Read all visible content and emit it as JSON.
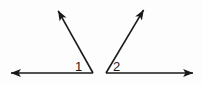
{
  "figure": {
    "type": "geometry-diagram",
    "background_color": "#fdfdfd",
    "stroke_color": "#1a1a1a",
    "stroke_width": 1.6,
    "width": 203,
    "height": 85,
    "labels": [
      {
        "name": "angle-1",
        "text": "1",
        "x": 75,
        "y": 60
      },
      {
        "name": "angle-2",
        "text": "2",
        "x": 113,
        "y": 60
      }
    ],
    "angles": [
      {
        "name": "angle-1",
        "label": "1",
        "vertex": {
          "x": 93,
          "y": 73
        },
        "rays": [
          {
            "name": "left-horizontal-ray",
            "from": {
              "x": 93,
              "y": 73
            },
            "to": {
              "x": 8,
              "y": 73
            },
            "arrow_at": "end"
          },
          {
            "name": "left-slanted-ray",
            "from": {
              "x": 93,
              "y": 73
            },
            "to": {
              "x": 56,
              "y": 7
            },
            "arrow_at": "end"
          }
        ]
      },
      {
        "name": "angle-2",
        "label": "2",
        "vertex": {
          "x": 106,
          "y": 73
        },
        "rays": [
          {
            "name": "right-horizontal-ray",
            "from": {
              "x": 106,
              "y": 73
            },
            "to": {
              "x": 196,
              "y": 73
            },
            "arrow_at": "end"
          },
          {
            "name": "right-slanted-ray",
            "from": {
              "x": 106,
              "y": 73
            },
            "to": {
              "x": 146,
              "y": 6
            },
            "arrow_at": "end"
          }
        ]
      }
    ]
  }
}
